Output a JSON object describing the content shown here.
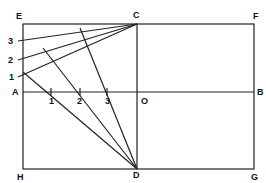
{
  "diagram": {
    "labels": {
      "E": "E",
      "C": "C",
      "F": "F",
      "A": "A",
      "O": "O",
      "B": "B",
      "H": "H",
      "D": "D",
      "G": "G",
      "left1": "1",
      "left2": "2",
      "left3": "3",
      "axis1": "1",
      "axis2": "2",
      "axis3": "3"
    },
    "points": {
      "E": [
        23,
        24
      ],
      "C": [
        137,
        24
      ],
      "F": [
        254,
        24
      ],
      "A": [
        23,
        92
      ],
      "O": [
        137,
        92
      ],
      "B": [
        254,
        92
      ],
      "H": [
        23,
        169
      ],
      "D": [
        137,
        169
      ],
      "G": [
        254,
        169
      ]
    },
    "stroke_color": "#222222"
  }
}
